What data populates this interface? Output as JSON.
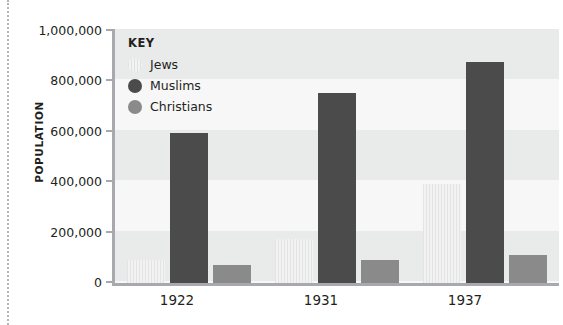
{
  "chart_data": {
    "type": "bar",
    "title": "",
    "subtitle": "",
    "xlabel": "",
    "ylabel": "POPULATION",
    "categories": [
      "1922",
      "1931",
      "1937"
    ],
    "series": [
      {
        "name": "Jews",
        "color": "#ececec",
        "values": [
          91000,
          175000,
          390000
        ]
      },
      {
        "name": "Muslims",
        "color": "#4b4b4b",
        "values": [
          591000,
          750000,
          869000
        ]
      },
      {
        "name": "Christians",
        "color": "#8a8a8a",
        "values": [
          71000,
          91000,
          111000
        ]
      }
    ],
    "ylim": [
      0,
      1000000
    ],
    "ytick_values": [
      0,
      200000,
      400000,
      600000,
      800000,
      1000000
    ],
    "ytick_labels": [
      "0",
      "200,000",
      "400,000",
      "600,000",
      "800,000",
      "1,000,000"
    ],
    "grid": "horizontal-bands",
    "legend_position": "inside-top-left",
    "legend_title": "KEY"
  },
  "legend": {
    "title": "KEY",
    "entries": [
      {
        "label": "Jews"
      },
      {
        "label": "Muslims"
      },
      {
        "label": "Christians"
      }
    ]
  },
  "axes": {
    "y_title": "POPULATION",
    "y_ticks": [
      "1,000,000",
      "800,000",
      "600,000",
      "400,000",
      "200,000",
      "0"
    ],
    "x_ticks": [
      "1922",
      "1931",
      "1937"
    ]
  }
}
